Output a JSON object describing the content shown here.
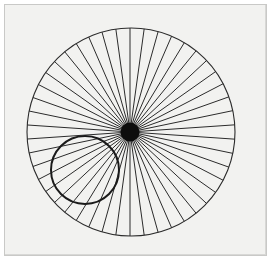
{
  "figure": {
    "canvas": {
      "width": 273,
      "height": 262
    },
    "background_color": "#ffffff",
    "plate": {
      "name": "drawing plate",
      "x": 4,
      "y": 4,
      "width": 263,
      "height": 252,
      "fill_color": "#f2f2f0",
      "border_color": "#c9c9c7",
      "border_width": 1
    },
    "line_color": "#1a1a1a",
    "outer_circle": {
      "label": "outer circle",
      "center_x": 131,
      "center_y": 132,
      "radius": 104,
      "stroke_color": "#2b2b2b",
      "stroke_width": 1.1,
      "fill": "none"
    },
    "small_circle": {
      "label": "rolling circle",
      "center_x": 85,
      "center_y": 170,
      "radius": 34,
      "stroke_color": "#1a1a1a",
      "stroke_width": 2.0,
      "fill": "none"
    },
    "hub": {
      "label": "hub",
      "center_x": 130,
      "center_y": 132,
      "radius": 9.5,
      "fill_color": "#0d0d0d"
    },
    "spokes": {
      "label": "radiating chords",
      "count": 46,
      "origin_x": 130,
      "origin_y": 132,
      "start_angle_deg": -90,
      "stroke_color": "#2b2b2b",
      "stroke_width": 1.0,
      "note": "Each chord runs from the hub centre outward to the outer circle; equal angular spacing of 360/46 degrees."
    }
  }
}
